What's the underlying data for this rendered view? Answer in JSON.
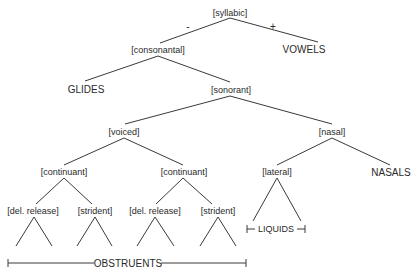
{
  "title": "",
  "nodes": {
    "syllabic": "[syllabic]",
    "consonantal": "[consonantal]",
    "vowels": "VOWELS",
    "glides": "GLIDES",
    "sonorant": "[sonorant]",
    "voiced": "[voiced]",
    "nasal": "[nasal]",
    "continuant_1": "[continuant]",
    "continuant_2": "[continuant]",
    "lateral": "[lateral]",
    "nasals": "NASALS",
    "del_release_1": "[del. release]",
    "strident_1": "[strident]",
    "del_release_2": "[del. release]",
    "strident_2": "[strident]"
  },
  "signs": {
    "minus": "-",
    "plus": "+"
  },
  "brackets": {
    "liquids": "LIQUIDS",
    "obstruents": "OBSTRUENTS"
  },
  "colors": {
    "line": "#3a3a3a",
    "text": "#2a2a2a",
    "background": "#ffffff"
  }
}
